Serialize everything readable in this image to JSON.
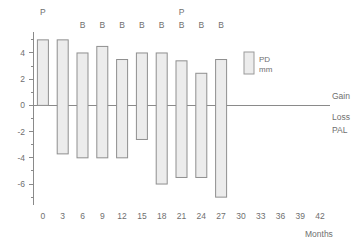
{
  "chart_data": {
    "type": "bar",
    "subtype": "floating-range-bar",
    "title": "",
    "subtitle": "",
    "xlabel": "Months",
    "ylabel": "",
    "xlim": [
      -1.5,
      43.5
    ],
    "ylim": [
      -7.6,
      5.6
    ],
    "grid": false,
    "zero_line": true,
    "legend": {
      "position": "inside-right",
      "entries": [
        {
          "label_line1": "PD",
          "label_line2": "mm",
          "swatch_fill": "#ececec",
          "swatch_border": "#9a9a9a"
        }
      ]
    },
    "y_ticks_major": [
      4,
      2,
      0,
      -2,
      -4,
      -6
    ],
    "y_tick_labels": [
      "4",
      "2",
      "0",
      "-2",
      "-4",
      "-6"
    ],
    "y_ticks_minor": [
      5,
      3,
      1,
      -1,
      -3,
      -5,
      -7
    ],
    "x_ticks": [
      0,
      3,
      6,
      9,
      12,
      15,
      18,
      21,
      24,
      27,
      30,
      33,
      36,
      39,
      42
    ],
    "x_tick_labels": [
      "0",
      "3",
      "6",
      "9",
      "12",
      "15",
      "18",
      "21",
      "24",
      "27",
      "30",
      "33",
      "36",
      "39",
      "42"
    ],
    "categories": [
      "0",
      "3",
      "6",
      "9",
      "12",
      "15",
      "18",
      "21",
      "24",
      "27"
    ],
    "series": [
      {
        "name": "PD mm",
        "gain_values": [
          5.0,
          5.0,
          4.0,
          4.5,
          3.5,
          4.0,
          4.0,
          3.4,
          2.45,
          3.5
        ],
        "loss_values": [
          0.0,
          -3.7,
          -4.0,
          -4.0,
          -4.0,
          -2.6,
          -6.0,
          -5.5,
          -5.5,
          -7.0
        ]
      }
    ],
    "bars": [
      {
        "month": 0,
        "top": 5.0,
        "bottom": 0.0,
        "marks": [
          "P"
        ]
      },
      {
        "month": 3,
        "top": 5.0,
        "bottom": -3.7,
        "marks": []
      },
      {
        "month": 6,
        "top": 4.0,
        "bottom": -4.0,
        "marks": [
          "B"
        ]
      },
      {
        "month": 9,
        "top": 4.5,
        "bottom": -4.0,
        "marks": [
          "B"
        ]
      },
      {
        "month": 12,
        "top": 3.5,
        "bottom": -4.0,
        "marks": [
          "B"
        ]
      },
      {
        "month": 15,
        "top": 4.0,
        "bottom": -2.6,
        "marks": [
          "B"
        ]
      },
      {
        "month": 18,
        "top": 4.0,
        "bottom": -6.0,
        "marks": [
          "B"
        ]
      },
      {
        "month": 21,
        "top": 3.4,
        "bottom": -5.5,
        "marks": [
          "P",
          "B"
        ]
      },
      {
        "month": 24,
        "top": 2.45,
        "bottom": -5.5,
        "marks": [
          "B"
        ]
      },
      {
        "month": 27,
        "top": 3.5,
        "bottom": -7.0,
        "marks": [
          "B"
        ]
      }
    ],
    "annotations": [
      {
        "text": "Gain",
        "position": "right-above-zero"
      },
      {
        "text": "Loss",
        "position": "right-below-zero"
      },
      {
        "text": "PAL",
        "position": "right-below-loss"
      }
    ],
    "colors": {
      "bar_fill": "#ececec",
      "bar_border": "#8f8f8f",
      "axis": "#8a8a8a",
      "text": "#6f6f6f",
      "background": "#ffffff"
    }
  },
  "axis": {
    "x_title": "Months"
  },
  "side": {
    "gain": "Gain",
    "loss": "Loss",
    "pal": "PAL"
  },
  "legend": {
    "line1": "PD",
    "line2": "mm"
  }
}
